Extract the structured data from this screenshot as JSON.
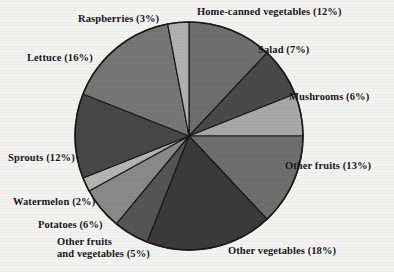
{
  "figure": {
    "background_color": "#f2f2f0",
    "text_color": "#17171a"
  },
  "chart_data": {
    "type": "pie",
    "title": "",
    "subtitle": "",
    "xlabel": "",
    "ylabel": "",
    "legend_position": "outside-labels",
    "grid": false,
    "units": "percent",
    "start_angle_deg": -90,
    "direction": "clockwise",
    "center": {
      "x": 189,
      "y": 136
    },
    "radius": 114,
    "categories": [
      "Home-canned vegetables",
      "Salad",
      "Mushrooms",
      "Other fruits",
      "Other vegetables",
      "Other fruits and vegetables",
      "Potatoes",
      "Watermelon",
      "Sprouts",
      "Lettuce",
      "Raspberries"
    ],
    "values": [
      12,
      7,
      6,
      13,
      18,
      5,
      6,
      2,
      12,
      16,
      3
    ],
    "slices": [
      {
        "label": "Home-canned vegetables",
        "value": 12,
        "label_text": "Home-canned vegetables (12%)",
        "color": "#6e6e6e"
      },
      {
        "label": "Salad",
        "value": 7,
        "label_text": "Salad (7%)",
        "color": "#494949"
      },
      {
        "label": "Mushrooms",
        "value": 6,
        "label_text": "Mushrooms (6%)",
        "color": "#a8a8a8"
      },
      {
        "label": "Other fruits",
        "value": 13,
        "label_text": "Other fruits (13%)",
        "color": "#6e6e6e"
      },
      {
        "label": "Other vegetables",
        "value": 18,
        "label_text": "Other vegetables (18%)",
        "color": "#3a3a3a"
      },
      {
        "label": "Other fruits and vegetables",
        "value": 5,
        "label_text": "Other fruits\nand vegetables (5%)",
        "color": "#555555"
      },
      {
        "label": "Potatoes",
        "value": 6,
        "label_text": "Potatoes (6%)",
        "color": "#898989"
      },
      {
        "label": "Watermelon",
        "value": 2,
        "label_text": "Watermelon (2%)",
        "color": "#b4b4b4"
      },
      {
        "label": "Sprouts",
        "value": 12,
        "label_text": "Sprouts (12%)",
        "color": "#474747"
      },
      {
        "label": "Lettuce",
        "value": 16,
        "label_text": "Lettuce (16%)",
        "color": "#767676"
      },
      {
        "label": "Raspberries",
        "value": 3,
        "label_text": "Raspberries (3%)",
        "color": "#b0b0b0"
      }
    ],
    "outline_color": "#1a1a1a"
  }
}
